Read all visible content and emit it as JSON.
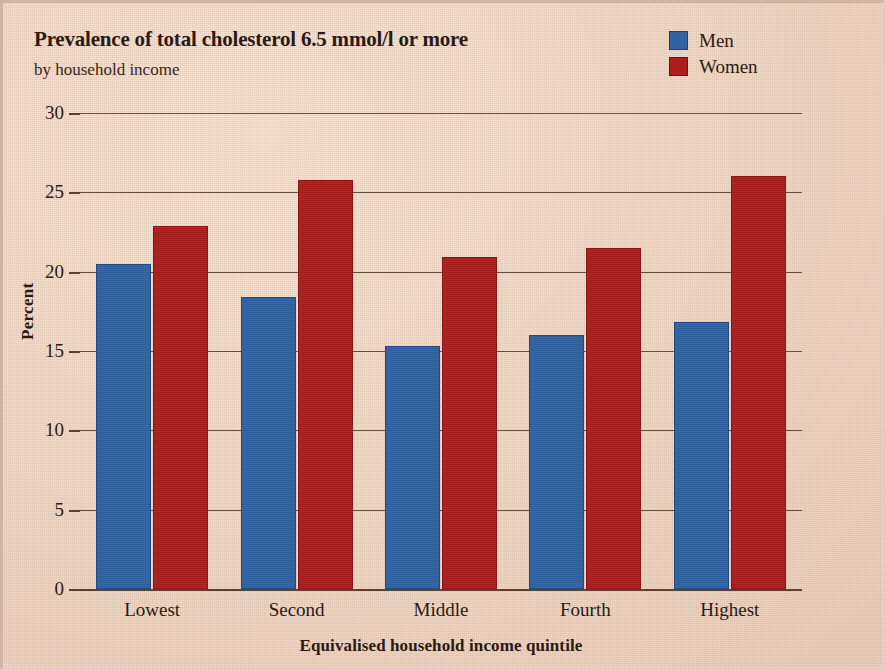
{
  "chart_data": {
    "type": "bar",
    "title": "Prevalence of total cholesterol 6.5 mmol/l or more",
    "subtitle": "by household income",
    "xlabel": "Equivalised household income quintile",
    "ylabel": "Percent",
    "categories": [
      "Lowest",
      "Second",
      "Middle",
      "Fourth",
      "Highest"
    ],
    "series": [
      {
        "name": "Men",
        "color": "#2f63a4",
        "values": [
          20.5,
          18.4,
          15.3,
          16.0,
          16.8
        ]
      },
      {
        "name": "Women",
        "color": "#ac1d1b",
        "values": [
          22.9,
          25.8,
          20.9,
          21.5,
          26.0
        ]
      }
    ],
    "ylim": [
      0,
      30
    ],
    "yticks": [
      0,
      5,
      10,
      15,
      20,
      25,
      30
    ],
    "ytick_labels": [
      "0",
      "5",
      "10",
      "15",
      "20",
      "25",
      "30"
    ],
    "grid": true,
    "legend_position": "top-right",
    "background_color": "#f1dac9"
  }
}
